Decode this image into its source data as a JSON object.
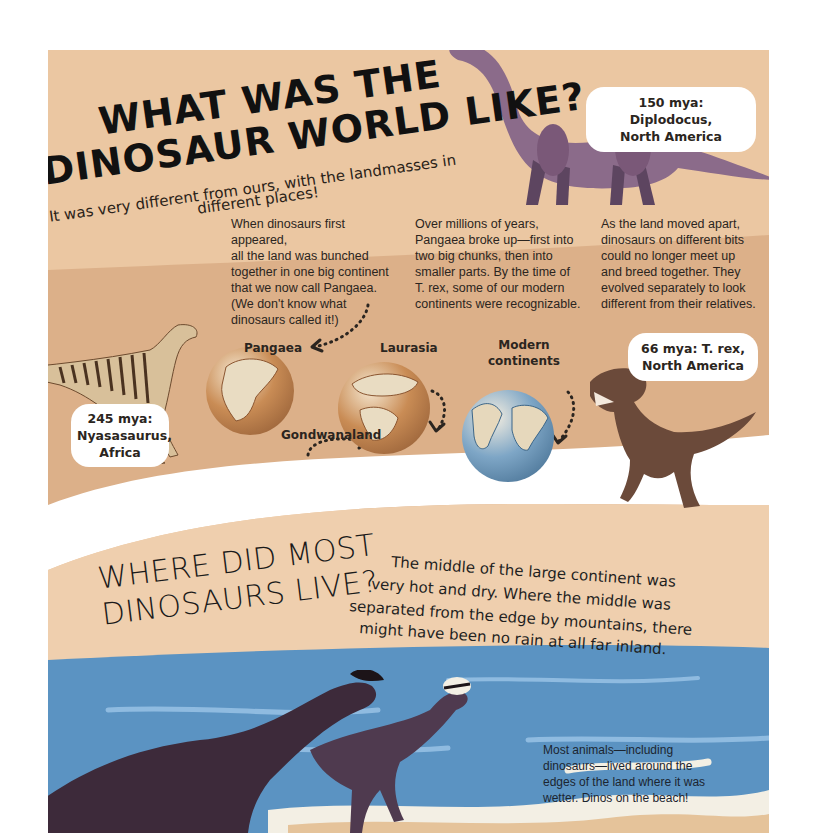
{
  "page": {
    "section1": {
      "title_line1": "WHAT WAS THE",
      "title_line2": "DINOSAUR WORLD LIKE?",
      "subtitle_line1": "It was very different from ours, with the landmasses in",
      "subtitle_line2": "different places!",
      "columns": [
        {
          "lines": [
            "When dinosaurs first appeared,",
            "all the land was bunched",
            "together in one big continent",
            "that we now call Pangaea.",
            "(We don't know what",
            "dinosaurs called it!)"
          ]
        },
        {
          "lines": [
            "Over millions of years,",
            "Pangaea broke up—first into",
            "two big chunks, then into",
            "smaller parts. By the time of",
            "T. rex, some of our modern",
            "continents were recognizable."
          ]
        },
        {
          "lines": [
            "As the land moved apart,",
            "dinosaurs on different bits",
            "could no longer meet up",
            "and breed together. They",
            "evolved separately to look",
            "different from their relatives."
          ]
        }
      ],
      "callouts": {
        "diplodocus": {
          "line1": "150 mya: Diplodocus,",
          "line2": "North America"
        },
        "trex": {
          "line1": "66 mya: T. rex,",
          "line2": "North America"
        },
        "nyasasaurus": {
          "line1": "245 mya:",
          "line2": "Nyasasaurus,",
          "line3": "Africa"
        }
      },
      "globe_labels": {
        "pangaea": "Pangaea",
        "laurasia": "Laurasia",
        "gondwanaland": "Gondwanaland",
        "modern_line1": "Modern",
        "modern_line2": "continents"
      }
    },
    "section2": {
      "title_line1": "WHERE DID MOST",
      "title_line2": "DINOSAURS LIVE?",
      "body_lines": [
        "The middle of the large continent was",
        "very hot and dry. Where the middle was",
        "separated from the edge by mountains, there",
        "might have been no rain at all far inland."
      ],
      "beach_lines": [
        "Most animals—including",
        "dinosaurs—lived around the",
        "edges of the land where it was",
        "wetter. Dinos on the beach!"
      ]
    },
    "colors": {
      "sand": "#ebc7a2",
      "band": "#dcb089",
      "sea": "#5b93c2",
      "sea_light": "#7fb0d6",
      "foam": "#f3efe4",
      "sky": "#f0cca6"
    }
  }
}
